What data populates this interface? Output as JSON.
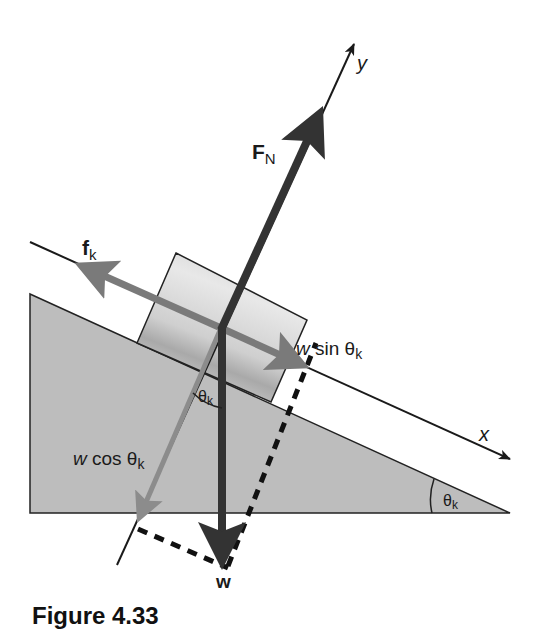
{
  "figure": {
    "caption": "Figure 4.33"
  },
  "axes": {
    "x_label": "x",
    "y_label": "y"
  },
  "forces": {
    "normal": {
      "symbol": "F",
      "subscript": "N"
    },
    "friction": {
      "symbol": "f",
      "subscript": "k"
    },
    "weight": {
      "symbol": "w"
    },
    "weight_parallel": {
      "prefix": "w",
      "text": " sin θ",
      "subscript": "k"
    },
    "weight_perpendicular": {
      "prefix": "w",
      "text": " cos θ",
      "subscript": "k"
    }
  },
  "angles": {
    "incline_angle": {
      "symbol": "θ",
      "subscript": "k"
    },
    "block_angle": {
      "symbol": "θ",
      "subscript": "k"
    }
  },
  "colors": {
    "incline_fill": "#bdbdbd",
    "dark_arrow": "#333333",
    "mid_arrow": "#7a7a7a",
    "light_arrow": "#8c8c8c",
    "axis_line": "#1a1a1a"
  }
}
